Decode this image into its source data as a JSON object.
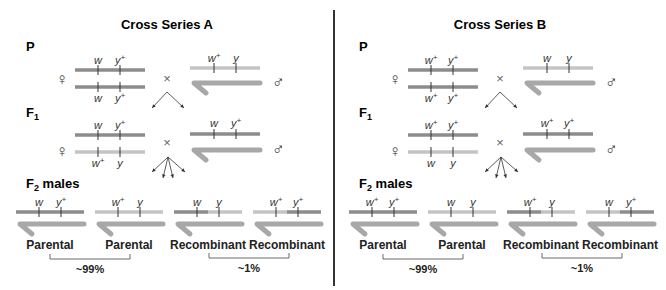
{
  "colors": {
    "dark": "#8c8c8c",
    "light": "#c4c4c4",
    "y_chrom": "#a8a8a8",
    "tick": "#333333",
    "divider": "#333333"
  },
  "panels": [
    {
      "title": "Cross Series A",
      "gen_p": "P",
      "gen_f1": "F",
      "gen_f1_sub": "1",
      "gen_f2": "F",
      "gen_f2_sub": "2",
      "gen_f2_rest": " males",
      "female_symbol": "♀",
      "male_symbol": "♂",
      "cross_symbol": "×",
      "p_female": {
        "top": [
          "w",
          "y+"
        ],
        "bottom": [
          "w",
          "y+"
        ],
        "top_color": "dark",
        "bottom_color": "dark"
      },
      "p_male": {
        "x": [
          "w+",
          "y"
        ],
        "x_color": "light"
      },
      "f1_female": {
        "top": [
          "w",
          "y+"
        ],
        "bottom": [
          "w+",
          "y"
        ],
        "top_color": "dark",
        "bottom_color": "light"
      },
      "f1_male": {
        "x": [
          "w",
          "y+"
        ],
        "x_color": "dark"
      },
      "f2_males": [
        {
          "alleles": [
            "w",
            "y+"
          ],
          "left": "dark",
          "right": "dark",
          "class": "Parental"
        },
        {
          "alleles": [
            "w+",
            "y"
          ],
          "left": "light",
          "right": "light",
          "class": "Parental"
        },
        {
          "alleles": [
            "w",
            "y"
          ],
          "left": "dark",
          "right": "light",
          "class": "Recombinant"
        },
        {
          "alleles": [
            "w+",
            "y+"
          ],
          "left": "light",
          "right": "dark",
          "class": "Recombinant"
        }
      ],
      "parental_pct": "~99%",
      "recombinant_pct": "~1%"
    },
    {
      "title": "Cross Series B",
      "gen_p": "P",
      "gen_f1": "F",
      "gen_f1_sub": "1",
      "gen_f2": "F",
      "gen_f2_sub": "2",
      "gen_f2_rest": " males",
      "female_symbol": "♀",
      "male_symbol": "♂",
      "cross_symbol": "×",
      "p_female": {
        "top": [
          "w+",
          "y+"
        ],
        "bottom": [
          "w+",
          "y+"
        ],
        "top_color": "dark",
        "bottom_color": "dark"
      },
      "p_male": {
        "x": [
          "w",
          "y"
        ],
        "x_color": "light"
      },
      "f1_female": {
        "top": [
          "w+",
          "y+"
        ],
        "bottom": [
          "w",
          "y"
        ],
        "top_color": "dark",
        "bottom_color": "light"
      },
      "f1_male": {
        "x": [
          "w+",
          "y+"
        ],
        "x_color": "dark"
      },
      "f2_males": [
        {
          "alleles": [
            "w+",
            "y+"
          ],
          "left": "dark",
          "right": "dark",
          "class": "Parental"
        },
        {
          "alleles": [
            "w",
            "y"
          ],
          "left": "light",
          "right": "light",
          "class": "Parental"
        },
        {
          "alleles": [
            "w+",
            "y"
          ],
          "left": "dark",
          "right": "light",
          "class": "Recombinant"
        },
        {
          "alleles": [
            "w",
            "y+"
          ],
          "left": "light",
          "right": "dark",
          "class": "Recombinant"
        }
      ],
      "parental_pct": "~99%",
      "recombinant_pct": "~1%"
    }
  ]
}
